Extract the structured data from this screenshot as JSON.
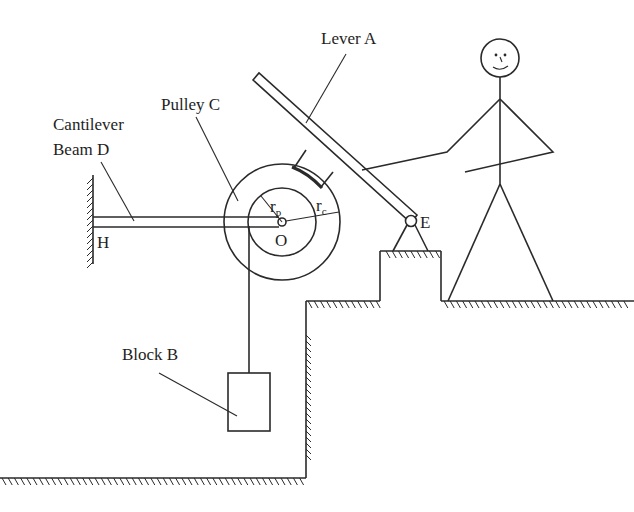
{
  "diagram": {
    "labels": {
      "lever": "Lever A",
      "pulley": "Pulley C",
      "beam_line1": "Cantilever",
      "beam_line2": "Beam D",
      "block": "Block B",
      "wall_point": "H",
      "center": "O",
      "pivot": "E",
      "r_pulley_main": "r",
      "r_pulley_sub": "p",
      "r_contact_main": "r",
      "r_contact_sub": "c"
    },
    "components": [
      {
        "id": "lever-A",
        "name": "Lever A",
        "type": "lever"
      },
      {
        "id": "block-B",
        "name": "Block B",
        "type": "block"
      },
      {
        "id": "pulley-C",
        "name": "Pulley C",
        "type": "pulley"
      },
      {
        "id": "beam-D",
        "name": "Cantilever Beam D",
        "type": "beam"
      },
      {
        "id": "point-H",
        "name": "H",
        "type": "fixed-support"
      },
      {
        "id": "point-O",
        "name": "O",
        "type": "pulley-center"
      },
      {
        "id": "point-E",
        "name": "E",
        "type": "pin-support"
      },
      {
        "id": "person",
        "name": "stick figure",
        "type": "actor"
      }
    ],
    "colors": {
      "stroke": "#2a2a2a",
      "background": "#ffffff"
    }
  }
}
